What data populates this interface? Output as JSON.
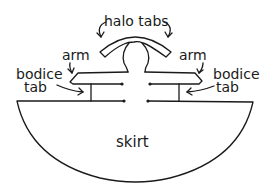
{
  "diagram": {
    "labels": {
      "halo_tabs": "halo tabs",
      "arm_left": "arm",
      "arm_right": "arm",
      "bodice_left_line1": "bodice",
      "bodice_left_line2": "tab",
      "bodice_right_line1": "bodice",
      "bodice_right_line2": "tab",
      "skirt": "skirt"
    },
    "parts": [
      "halo tabs",
      "arm",
      "bodice tab",
      "skirt"
    ],
    "colors": {
      "ink": "#1a1a1a",
      "background": "#ffffff"
    }
  }
}
